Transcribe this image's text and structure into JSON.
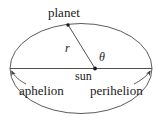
{
  "figure": {
    "kind": "orbital-diagram",
    "background_color": "#ffffff",
    "stroke_color": "#3c3c3c",
    "text_color": "#1a1a1a",
    "width": 163,
    "height": 125
  },
  "labels": {
    "planet": "planet",
    "sun": "sun",
    "aphelion": "aphelion",
    "perihelion": "perihelion",
    "radius": "r",
    "angle": "θ"
  },
  "geometry": {
    "ellipse": {
      "cx": 81,
      "cy": 68.5,
      "rx": 71,
      "ry": 45
    },
    "major_axis": {
      "x1": 10,
      "y1": 68.5,
      "x2": 152,
      "y2": 68.5
    },
    "sun_point": {
      "x": 95,
      "y": 68.5
    },
    "planet_point": {
      "x": 68,
      "y": 25
    },
    "radius_line": {
      "x1": 95,
      "y1": 68.5,
      "x2": 68,
      "y2": 25
    },
    "aphelion_vertex": {
      "x": 10,
      "y": 68.5
    },
    "perihelion_vertex": {
      "x": 152,
      "y": 68.5
    }
  }
}
